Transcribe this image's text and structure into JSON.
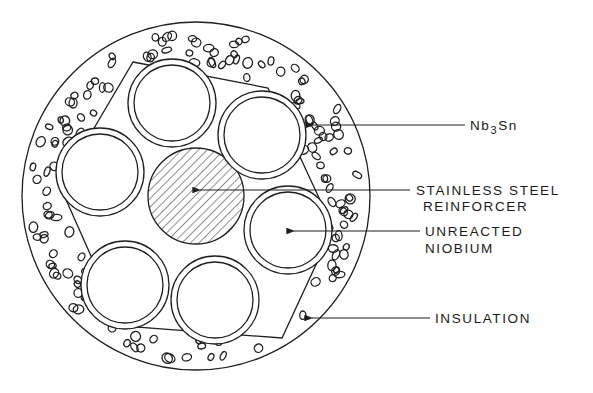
{
  "diagram": {
    "type": "cross-section",
    "colors": {
      "ink": "#1f1f1f",
      "background": "#ffffff"
    },
    "labels": {
      "nb3sn": {
        "prefix": "Nb",
        "subscript": "3",
        "suffix": "Sn"
      },
      "reinforcer": {
        "line1": "STAINLESS STEEL",
        "line2": "REINFORCER"
      },
      "niobium": {
        "line1": "UNREACTED",
        "line2": "NIOBIUM"
      },
      "insulation": {
        "line1": "INSULATION"
      }
    },
    "components": [
      {
        "name": "Nb3Sn",
        "count": 6,
        "shape": "tube ring"
      },
      {
        "name": "Stainless steel reinforcer",
        "count": 1,
        "shape": "hatched central core"
      },
      {
        "name": "Unreacted niobium",
        "count": 6,
        "shape": "tube interior"
      },
      {
        "name": "Insulation",
        "count": 1,
        "shape": "outer speckled annulus"
      }
    ]
  }
}
